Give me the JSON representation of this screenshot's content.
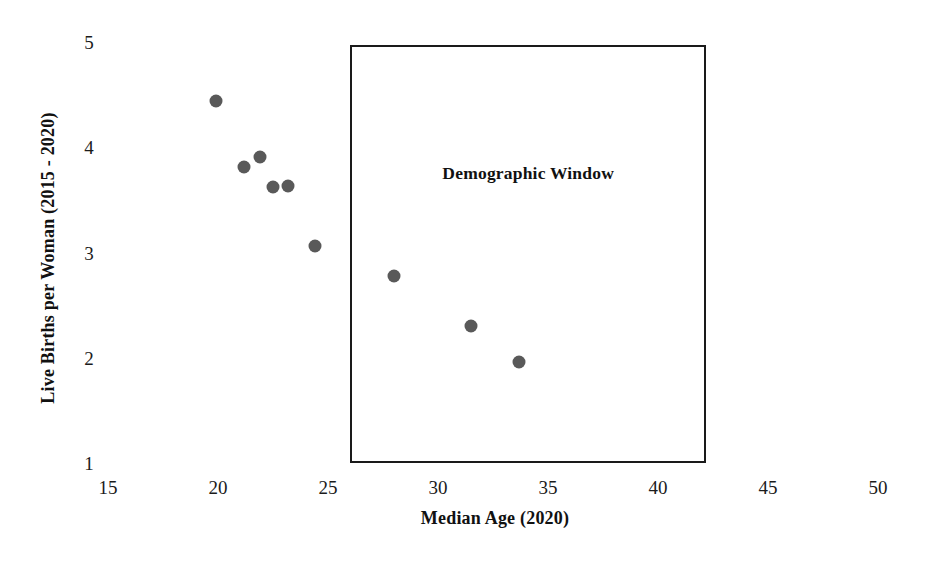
{
  "chart_data": {
    "type": "scatter",
    "title": "",
    "xlabel": "Median Age (2020)",
    "ylabel": "Live Births per Woman (2015 - 2020)",
    "xlim": [
      15,
      50
    ],
    "ylim": [
      1,
      5
    ],
    "xticks": [
      15,
      20,
      25,
      30,
      35,
      40,
      45,
      50
    ],
    "yticks": [
      1,
      2,
      3,
      4,
      5
    ],
    "xtick_labels": [
      "15",
      "20",
      "25",
      "30",
      "35",
      "40",
      "45",
      "50"
    ],
    "ytick_labels": [
      "1",
      "2",
      "3",
      "4",
      "5"
    ],
    "grid": false,
    "legend": false,
    "marker_color": "#595959",
    "marker_shape": "circle",
    "points": [
      {
        "x": 19.9,
        "y": 4.44
      },
      {
        "x": 21.2,
        "y": 3.81
      },
      {
        "x": 21.9,
        "y": 3.91
      },
      {
        "x": 22.5,
        "y": 3.62
      },
      {
        "x": 23.2,
        "y": 3.63
      },
      {
        "x": 24.4,
        "y": 3.06
      },
      {
        "x": 28.0,
        "y": 2.78
      },
      {
        "x": 31.5,
        "y": 2.3
      },
      {
        "x": 33.7,
        "y": 1.96
      }
    ],
    "annotations": [
      {
        "label": "Demographic Window",
        "type": "rectangle",
        "x0": 26.0,
        "x1": 42.2,
        "y0": 1.0,
        "y1": 4.97,
        "label_x": 34.1,
        "label_y": 3.76,
        "border_color": "#1a1a1a"
      }
    ]
  },
  "axes": {
    "x_title": "Median Age (2020)",
    "y_title": "Live Births per Woman (2015 - 2020)"
  },
  "annotation": {
    "window_label": "Demographic Window"
  }
}
